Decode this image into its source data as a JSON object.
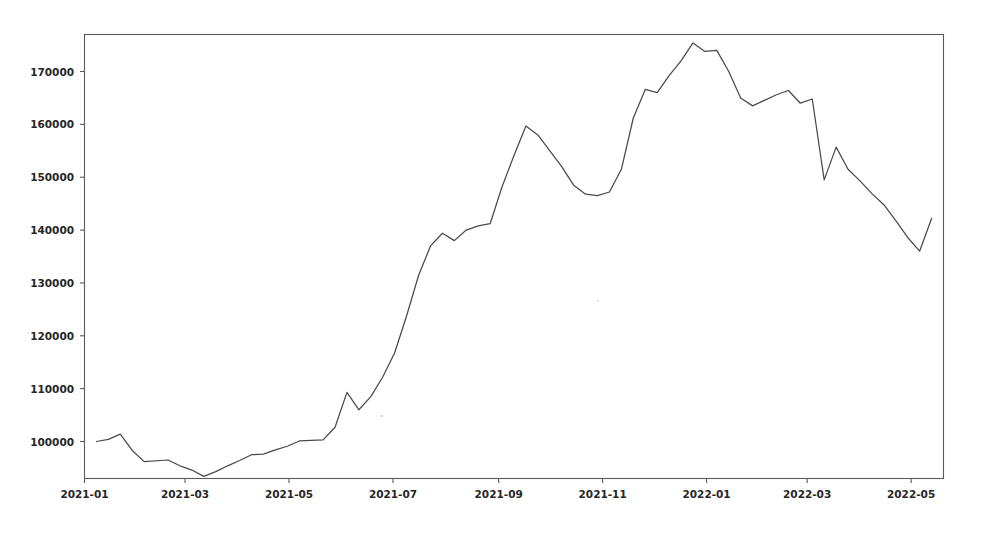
{
  "chart_data": {
    "type": "line",
    "title": "",
    "subtitle": "",
    "xlabel": "",
    "ylabel": "（元）",
    "unit_label": "（元）",
    "grid": false,
    "legend": null,
    "legend_position": "none",
    "line_color": "#4a4a4a",
    "axis_color": "#5a5a5a",
    "background_color": "#ffffff",
    "ylim": [
      93000,
      177000
    ],
    "yticks": [
      100000,
      110000,
      120000,
      130000,
      140000,
      150000,
      160000,
      170000
    ],
    "ytick_labels": [
      "100000",
      "110000",
      "120000",
      "130000",
      "140000",
      "150000",
      "160000",
      "170000"
    ],
    "xticks": [
      "2021-01",
      "2021-03",
      "2021-05",
      "2021-07",
      "2021-09",
      "2021-11",
      "2022-01",
      "2022-03",
      "2022-05"
    ],
    "xtick_labels": [
      "2021-01",
      "2021-03",
      "2021-05",
      "2021-07",
      "2021-09",
      "2021-11",
      "2022-01",
      "2022-03",
      "2022-05"
    ],
    "xlim": [
      "2021-01-01",
      "2022-05-20"
    ],
    "x": [
      "2021-01-08",
      "2021-01-15",
      "2021-01-22",
      "2021-01-29",
      "2021-02-05",
      "2021-02-19",
      "2021-02-26",
      "2021-03-05",
      "2021-03-12",
      "2021-03-19",
      "2021-03-26",
      "2021-04-02",
      "2021-04-09",
      "2021-04-16",
      "2021-04-23",
      "2021-04-30",
      "2021-05-07",
      "2021-05-14",
      "2021-05-21",
      "2021-05-28",
      "2021-06-04",
      "2021-06-11",
      "2021-06-18",
      "2021-06-25",
      "2021-07-02",
      "2021-07-09",
      "2021-07-16",
      "2021-07-23",
      "2021-07-30",
      "2021-08-06",
      "2021-08-13",
      "2021-08-20",
      "2021-08-27",
      "2021-09-03",
      "2021-09-10",
      "2021-09-17",
      "2021-09-24",
      "2021-10-08",
      "2021-10-15",
      "2021-10-22",
      "2021-10-29",
      "2021-11-05",
      "2021-11-12",
      "2021-11-19",
      "2021-11-26",
      "2021-12-03",
      "2021-12-10",
      "2021-12-17",
      "2021-12-24",
      "2021-12-31",
      "2022-01-07",
      "2022-01-14",
      "2022-01-21",
      "2022-01-28",
      "2022-02-11",
      "2022-02-18",
      "2022-02-25",
      "2022-03-04",
      "2022-03-11",
      "2022-03-18",
      "2022-03-25",
      "2022-04-01",
      "2022-04-08",
      "2022-04-15",
      "2022-04-22",
      "2022-04-29",
      "2022-05-06",
      "2022-05-13"
    ],
    "values": [
      100000,
      100400,
      101400,
      98300,
      96200,
      96500,
      95400,
      94600,
      93400,
      94300,
      95400,
      96400,
      97500,
      97600,
      98400,
      99100,
      100100,
      100200,
      100300,
      102700,
      109300,
      106000,
      108500,
      112200,
      116800,
      123800,
      131400,
      137000,
      139400,
      138000,
      140000,
      140800,
      141200,
      148200,
      154100,
      159700,
      158000,
      152000,
      148500,
      146800,
      146500,
      147200,
      151500,
      161200,
      166600,
      166000,
      169200,
      172000,
      175400,
      173800,
      174000,
      170000,
      165000,
      163500,
      165600,
      166400,
      164000,
      164800,
      149500,
      155700,
      151500,
      149300,
      146900,
      144800,
      141800,
      138600,
      136000,
      142200
    ]
  },
  "axes": {
    "unit_label": "（元）"
  }
}
